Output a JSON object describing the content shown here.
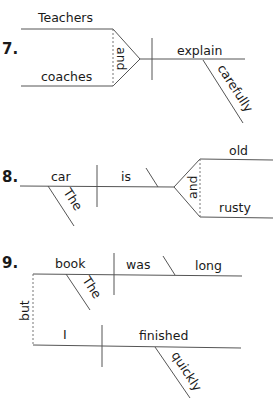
{
  "diagrams": [
    {
      "number": "7.",
      "words": {
        "subject_top": "Teachers",
        "subject_bottom": "coaches",
        "conjunction": "and",
        "verb": "explain",
        "adverb": "carefully"
      }
    },
    {
      "number": "8.",
      "words": {
        "subject": "car",
        "article": "The",
        "verb": "is",
        "conjunction": "and",
        "complement_top": "old",
        "complement_bottom": "rusty"
      }
    },
    {
      "number": "9.",
      "words": {
        "subject_1": "book",
        "article_1": "The",
        "verb_1": "was",
        "complement_1": "long",
        "conjunction": "but",
        "subject_2": "I",
        "verb_2": "finished",
        "adverb_2": "quickly"
      }
    }
  ],
  "colors": {
    "line": "#555555",
    "text": "#1a1a1a"
  }
}
